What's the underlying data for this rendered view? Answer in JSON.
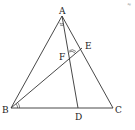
{
  "diagram": {
    "type": "geometry-triangle",
    "points": {
      "A": {
        "label": "A",
        "x": 62,
        "y": 16
      },
      "B": {
        "label": "B",
        "x": 11,
        "y": 108
      },
      "C": {
        "label": "C",
        "x": 113,
        "y": 108
      },
      "D": {
        "label": "D",
        "x": 78,
        "y": 108
      },
      "E": {
        "label": "E",
        "x": 80,
        "y": 50
      },
      "F": {
        "label": "F",
        "x": 70,
        "y": 57
      }
    },
    "segments": [
      "AB",
      "BC",
      "CA",
      "AD",
      "BE"
    ],
    "angle_marks": [
      "angle-BAD",
      "angle-ABE",
      "angle-AFE"
    ],
    "corner_mark": "≈"
  }
}
